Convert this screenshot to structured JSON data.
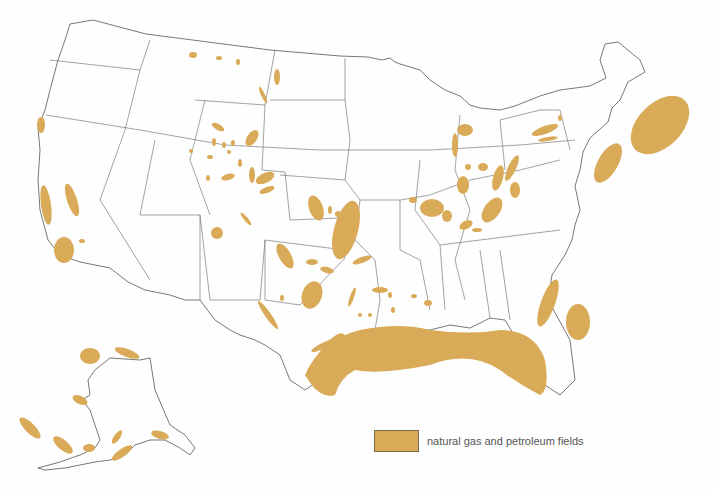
{
  "map": {
    "title": "United States natural gas and petroleum fields",
    "field_color": "#d9ab58",
    "border_color": "#555555",
    "regions": [
      "Contiguous United States",
      "Alaska"
    ]
  },
  "legend": {
    "items": [
      {
        "label": "natural gas and petroleum fields",
        "color": "#d9ab58"
      }
    ]
  }
}
